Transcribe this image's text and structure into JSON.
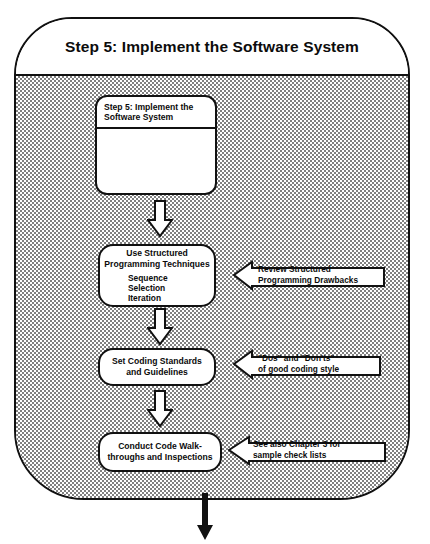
{
  "diagram": {
    "title": "Step 5: Implement the Software System",
    "nodes": {
      "step_box": {
        "header": "Step 5: Implement the\nSoftware System",
        "header_line1": "Step 5: Implement the",
        "header_line2": "Software System",
        "body": ""
      },
      "structured": {
        "line1": "Use Structured",
        "line2": "Programming Techniques",
        "items": [
          "Sequence",
          "Selection",
          "Iteration"
        ]
      },
      "standards": {
        "line1": "Set Coding Standards",
        "line2": "and Guidelines"
      },
      "walkthroughs": {
        "line1": "Conduct Code Walk-",
        "line2": "throughs and Inspections"
      }
    },
    "callouts": {
      "review": {
        "line1": "Review Structured",
        "line2": "Programming Drawbacks"
      },
      "dos": {
        "line1": "\"Dos\" and \"Don'ts\"",
        "line2": "of good coding style"
      },
      "chapter": {
        "line1": "See also Chapter 3 for",
        "line2": "sample check lists"
      }
    },
    "colors": {
      "ink": "#111111",
      "paper": "#ffffff",
      "fill_gray": "#808080"
    }
  }
}
